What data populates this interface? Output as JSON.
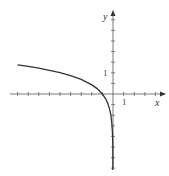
{
  "chart_data": {
    "type": "line",
    "title": "",
    "xlabel": "x",
    "ylabel": "y",
    "tick_labels": {
      "x": [
        "1"
      ],
      "y": [
        "1"
      ]
    },
    "series": [
      {
        "name": "y = ln(-x)",
        "x": [
          -9,
          -8,
          -7,
          -6,
          -5,
          -4,
          -3,
          -2,
          -1.5,
          -1,
          -0.7,
          -0.5,
          -0.3,
          -0.2,
          -0.1,
          -0.05,
          -0.02,
          -0.005
        ],
        "y": [
          2.2,
          2.08,
          1.95,
          1.79,
          1.61,
          1.39,
          1.1,
          0.69,
          0.41,
          0,
          -0.36,
          -0.69,
          -1.2,
          -1.61,
          -2.3,
          -3.0,
          -3.9,
          -5.3
        ]
      }
    ],
    "xlim": [
      -9.5,
      3.8
    ],
    "ylim": [
      -7.5,
      7.5
    ],
    "grid": false,
    "legend": "none"
  },
  "axes": {
    "x_label": "x",
    "y_label": "y",
    "x_tick_one": "1",
    "y_tick_one": "1"
  }
}
